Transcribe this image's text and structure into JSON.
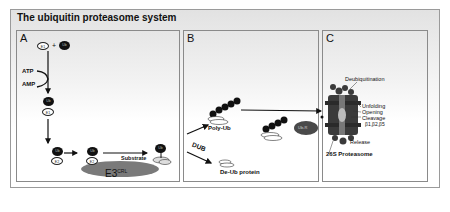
{
  "figure": {
    "title": "The ubiquitin proteasome system",
    "panels": [
      {
        "label": "A",
        "nodes": {
          "e1": "E1",
          "ub": "Ub",
          "plus": "+",
          "atp": "ATP",
          "amp": "AMP",
          "e2": "E2",
          "substrate": "Substrate",
          "e3": "E3",
          "e3_sup": "CRL"
        }
      },
      {
        "label": "B",
        "nodes": {
          "poly_ub": "Poly-Ub",
          "dub": "DUB",
          "de_ub_protein": "De-Ub protein",
          "ub_r": "Ub-R"
        }
      },
      {
        "label": "C",
        "nodes": {
          "deubiquitination": "Deubiquitination",
          "unfolding": "Unfolding",
          "opening": "Opening",
          "cleavage": "Cleavage",
          "cleavage_sites": "β1,β2,β5",
          "release": "Release",
          "proteasome": "26S Proteasome"
        }
      }
    ],
    "colors": {
      "ub_fill": "#111111",
      "e3_fill": "#7a7a7a",
      "proteasome_fill": "#3a3a3a",
      "border": "#8a8a8a"
    }
  }
}
